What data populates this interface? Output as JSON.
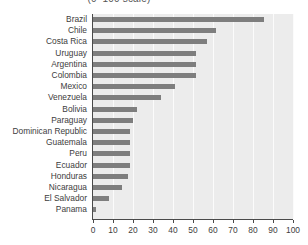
{
  "chart_data": {
    "type": "bar",
    "orientation": "horizontal",
    "title": "(0–100 scale)",
    "xlabel": "",
    "ylabel": "",
    "xlim": [
      0,
      100
    ],
    "xticks": [
      0,
      10,
      20,
      30,
      40,
      50,
      60,
      70,
      80,
      90,
      100
    ],
    "xtick_labels": [
      "0",
      "10",
      "20",
      "30",
      "40",
      "50",
      "60",
      "70",
      "80",
      "90",
      "100"
    ],
    "grid": true,
    "grid_axis": "x",
    "legend": null,
    "categories": [
      "Brazil",
      "Chile",
      "Costa Rica",
      "Uruguay",
      "Argentina",
      "Colombia",
      "Mexico",
      "Venezuela",
      "Bolivia",
      "Paraguay",
      "Dominican Republic",
      "Guatemala",
      "Peru",
      "Ecuador",
      "Honduras",
      "Nicaragua",
      "El Salvador",
      "Panama"
    ],
    "values": [
      85.5,
      61.5,
      57,
      51.5,
      51.5,
      51.5,
      41,
      34,
      22,
      20,
      18.5,
      18.5,
      18.5,
      18.5,
      17.5,
      14.5,
      8,
      1.5
    ]
  },
  "style": {
    "bar_color": "#7e7e7e",
    "plot_background": "#ececec",
    "gridline_color": "#fbfbfb",
    "axis_color": "#4a4a4a",
    "text_color": "#3d3d3d",
    "page_background": "#ffffff"
  }
}
